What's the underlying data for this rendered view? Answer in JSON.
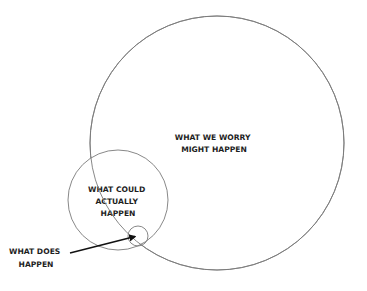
{
  "diagram": {
    "type": "nested-circles",
    "colors": {
      "background": "#ffffff",
      "circle_stroke": "#7a7a7a",
      "text": "#1e1e1e",
      "arrow": "#111111"
    },
    "circles": [
      {
        "id": "worry",
        "label_lines": [
          "WHAT WE WORRY",
          "MIGHT HAPPEN"
        ],
        "cx": 217,
        "cy": 143,
        "r": 127
      },
      {
        "id": "could",
        "label_lines": [
          "WHAT COULD",
          "ACTUALLY",
          "HAPPEN"
        ],
        "cx": 118,
        "cy": 200,
        "r": 50
      },
      {
        "id": "does",
        "label_lines": [
          "WHAT DOES",
          "HAPPEN"
        ],
        "cx": 138,
        "cy": 236,
        "r": 10
      }
    ],
    "arrow": {
      "from": [
        70,
        253
      ],
      "to": [
        137,
        236
      ],
      "points_to": "does"
    }
  }
}
